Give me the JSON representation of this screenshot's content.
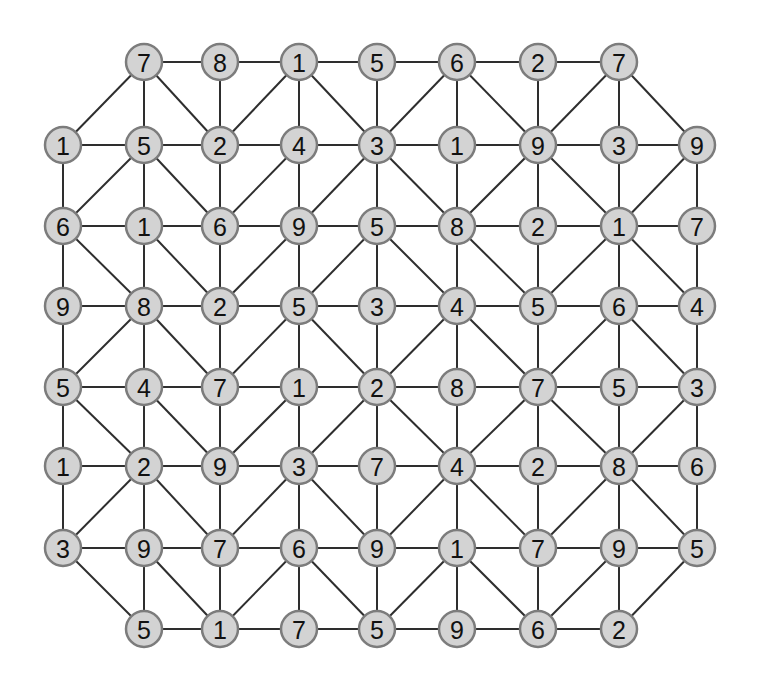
{
  "diagram": {
    "type": "number-graph-grid",
    "columns_x": [
      63,
      144,
      220,
      299,
      377,
      457,
      538,
      619,
      697
    ],
    "rows_y": [
      62,
      145,
      226,
      306,
      387,
      466,
      548,
      629
    ],
    "node_radius": 18,
    "colors": {
      "background": "#ffffff",
      "node_fill": "#d3d3d3",
      "node_border": "#7c7c7c",
      "edge": "#2e2e2e",
      "text": "#111111"
    },
    "grid": [
      [
        null,
        7,
        8,
        1,
        5,
        6,
        2,
        7,
        null
      ],
      [
        1,
        5,
        2,
        4,
        3,
        1,
        9,
        3,
        9
      ],
      [
        6,
        1,
        6,
        9,
        5,
        8,
        2,
        1,
        7
      ],
      [
        9,
        8,
        2,
        5,
        3,
        4,
        5,
        6,
        4
      ],
      [
        5,
        4,
        7,
        1,
        2,
        8,
        7,
        5,
        3
      ],
      [
        1,
        2,
        9,
        3,
        7,
        4,
        2,
        8,
        6
      ],
      [
        3,
        9,
        7,
        6,
        9,
        1,
        7,
        9,
        5
      ],
      [
        null,
        5,
        1,
        7,
        5,
        9,
        6,
        2,
        null
      ]
    ],
    "diagonal_edges": [
      [
        [
          0,
          1
        ],
        [
          1,
          0
        ]
      ],
      [
        [
          0,
          1
        ],
        [
          1,
          2
        ]
      ],
      [
        [
          0,
          3
        ],
        [
          1,
          2
        ]
      ],
      [
        [
          0,
          3
        ],
        [
          1,
          4
        ]
      ],
      [
        [
          0,
          5
        ],
        [
          1,
          4
        ]
      ],
      [
        [
          0,
          5
        ],
        [
          1,
          6
        ]
      ],
      [
        [
          0,
          7
        ],
        [
          1,
          6
        ]
      ],
      [
        [
          0,
          7
        ],
        [
          1,
          8
        ]
      ],
      [
        [
          1,
          1
        ],
        [
          2,
          0
        ]
      ],
      [
        [
          1,
          1
        ],
        [
          2,
          2
        ]
      ],
      [
        [
          1,
          3
        ],
        [
          2,
          2
        ]
      ],
      [
        [
          1,
          4
        ],
        [
          2,
          3
        ]
      ],
      [
        [
          1,
          4
        ],
        [
          2,
          5
        ]
      ],
      [
        [
          1,
          6
        ],
        [
          2,
          5
        ]
      ],
      [
        [
          1,
          6
        ],
        [
          2,
          7
        ]
      ],
      [
        [
          1,
          8
        ],
        [
          2,
          7
        ]
      ],
      [
        [
          2,
          0
        ],
        [
          3,
          1
        ]
      ],
      [
        [
          2,
          1
        ],
        [
          3,
          2
        ]
      ],
      [
        [
          2,
          3
        ],
        [
          3,
          2
        ]
      ],
      [
        [
          2,
          4
        ],
        [
          3,
          3
        ]
      ],
      [
        [
          2,
          4
        ],
        [
          3,
          5
        ]
      ],
      [
        [
          2,
          5
        ],
        [
          3,
          6
        ]
      ],
      [
        [
          2,
          7
        ],
        [
          3,
          6
        ]
      ],
      [
        [
          2,
          7
        ],
        [
          3,
          8
        ]
      ],
      [
        [
          3,
          1
        ],
        [
          4,
          0
        ]
      ],
      [
        [
          3,
          1
        ],
        [
          4,
          2
        ]
      ],
      [
        [
          3,
          3
        ],
        [
          4,
          2
        ]
      ],
      [
        [
          3,
          3
        ],
        [
          4,
          4
        ]
      ],
      [
        [
          3,
          5
        ],
        [
          4,
          4
        ]
      ],
      [
        [
          3,
          5
        ],
        [
          4,
          6
        ]
      ],
      [
        [
          3,
          7
        ],
        [
          4,
          6
        ]
      ],
      [
        [
          3,
          7
        ],
        [
          4,
          8
        ]
      ],
      [
        [
          4,
          0
        ],
        [
          5,
          1
        ]
      ],
      [
        [
          4,
          1
        ],
        [
          5,
          2
        ]
      ],
      [
        [
          4,
          3
        ],
        [
          5,
          2
        ]
      ],
      [
        [
          4,
          4
        ],
        [
          5,
          3
        ]
      ],
      [
        [
          4,
          4
        ],
        [
          5,
          5
        ]
      ],
      [
        [
          4,
          6
        ],
        [
          5,
          5
        ]
      ],
      [
        [
          4,
          6
        ],
        [
          5,
          7
        ]
      ],
      [
        [
          4,
          8
        ],
        [
          5,
          7
        ]
      ],
      [
        [
          5,
          1
        ],
        [
          6,
          0
        ]
      ],
      [
        [
          5,
          1
        ],
        [
          6,
          2
        ]
      ],
      [
        [
          5,
          3
        ],
        [
          6,
          2
        ]
      ],
      [
        [
          5,
          3
        ],
        [
          6,
          4
        ]
      ],
      [
        [
          5,
          5
        ],
        [
          6,
          4
        ]
      ],
      [
        [
          5,
          5
        ],
        [
          6,
          6
        ]
      ],
      [
        [
          5,
          7
        ],
        [
          6,
          6
        ]
      ],
      [
        [
          5,
          7
        ],
        [
          6,
          8
        ]
      ],
      [
        [
          6,
          0
        ],
        [
          7,
          1
        ]
      ],
      [
        [
          6,
          1
        ],
        [
          7,
          2
        ]
      ],
      [
        [
          6,
          3
        ],
        [
          7,
          2
        ]
      ],
      [
        [
          6,
          3
        ],
        [
          7,
          4
        ]
      ],
      [
        [
          6,
          5
        ],
        [
          7,
          4
        ]
      ],
      [
        [
          6,
          5
        ],
        [
          7,
          6
        ]
      ],
      [
        [
          6,
          7
        ],
        [
          7,
          6
        ]
      ],
      [
        [
          6,
          8
        ],
        [
          7,
          7
        ]
      ]
    ]
  }
}
